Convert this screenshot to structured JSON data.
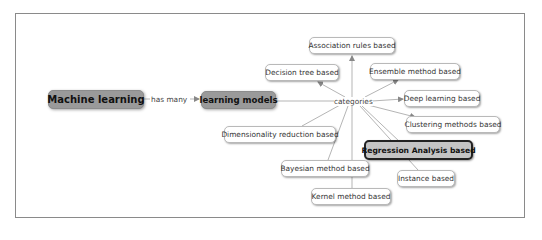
{
  "diagram": {
    "type": "concept-map",
    "root": {
      "label": "Machine learning"
    },
    "root_link": {
      "label": "has many"
    },
    "hub": {
      "label": "learning models"
    },
    "hub_link": {
      "label": "categories"
    },
    "categories": [
      {
        "label": "Association rules based"
      },
      {
        "label": "Decision tree based"
      },
      {
        "label": "Ensemble method based"
      },
      {
        "label": "Deep learning based"
      },
      {
        "label": "Clustering methods based"
      },
      {
        "label": "Regression Analysis based",
        "highlighted": true
      },
      {
        "label": "Instance based"
      },
      {
        "label": "Kernel method based"
      },
      {
        "label": "Bayesian method based"
      },
      {
        "label": "Dimensionality reduction based"
      }
    ]
  },
  "colors": {
    "main_node_fill": "#9a9a9a",
    "highlight_fill": "#c4c4c4",
    "highlight_border": "#222222",
    "leaf_fill": "#ffffff",
    "link": "#b0b0b0"
  }
}
